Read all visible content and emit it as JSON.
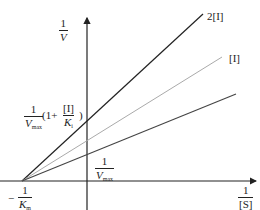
{
  "diagram": {
    "type": "Lineweaver-Burk plot (competitive inhibition)",
    "y_axis_label": {
      "num": "1",
      "den": "V"
    },
    "x_axis_label": {
      "num": "1",
      "den": "[S]"
    },
    "x_intercept_label": {
      "sign": "−",
      "num": "1",
      "den": "K",
      "den_sub": "m"
    },
    "y_intercept_label": {
      "num": "1",
      "den": "V",
      "den_sub": "max"
    },
    "inhibited_intercept_label": {
      "num": "1",
      "den": "V",
      "den_sub": "max",
      "open": "(1+",
      "frac_num": "[I]",
      "frac_den": "K",
      "frac_den_sub": "i",
      "close": ")"
    },
    "lines": [
      {
        "label": "2[I]",
        "color": "#222222"
      },
      {
        "label": "[I]",
        "color": "#aaaaaa"
      },
      {
        "label": "",
        "color": "#444444"
      }
    ],
    "colors": {
      "axis": "#222222"
    }
  }
}
